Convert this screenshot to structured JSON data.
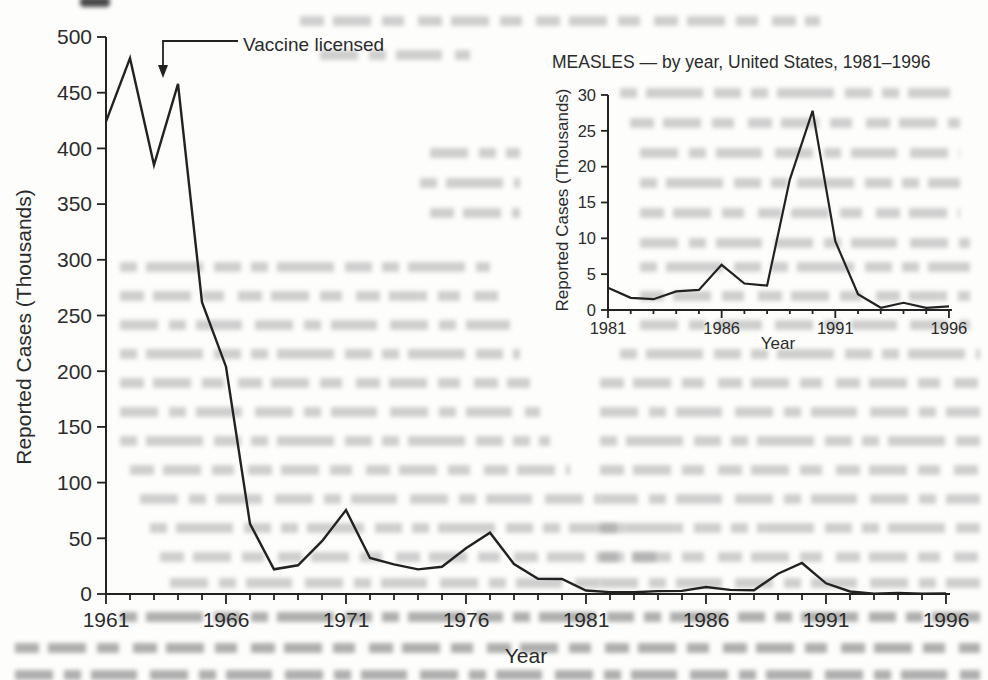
{
  "colors": {
    "paper": "#fdfdfc",
    "ink": "#222222",
    "text": "#2b2b2b"
  },
  "chart_data": [
    {
      "id": "main",
      "type": "line",
      "title": "",
      "xlabel": "Year",
      "ylabel": "Reported Cases (Thousands)",
      "xlim": [
        1961,
        1996
      ],
      "ylim": [
        0,
        500
      ],
      "x_major_ticks": [
        1961,
        1966,
        1971,
        1976,
        1981,
        1986,
        1991,
        1996
      ],
      "x_minor_tick_every": 1,
      "y_ticks": [
        0,
        50,
        100,
        150,
        200,
        250,
        300,
        350,
        400,
        450,
        500
      ],
      "grid": false,
      "legend": "none",
      "annotation": {
        "label": "Vaccine licensed",
        "target_year": 1963
      },
      "x": [
        1961,
        1962,
        1963,
        1964,
        1965,
        1966,
        1967,
        1968,
        1969,
        1970,
        1971,
        1972,
        1973,
        1974,
        1975,
        1976,
        1977,
        1978,
        1979,
        1980,
        1981,
        1982,
        1983,
        1984,
        1985,
        1986,
        1987,
        1988,
        1989,
        1990,
        1991,
        1992,
        1993,
        1994,
        1995,
        1996
      ],
      "values": [
        424,
        481,
        385,
        458,
        262,
        204,
        63,
        22.2,
        25.8,
        47.4,
        75.3,
        32.3,
        26.7,
        22.1,
        24.4,
        41.1,
        55,
        26.9,
        13.6,
        13.5,
        3.1,
        1.7,
        1.5,
        2.6,
        2.8,
        6.3,
        3.7,
        3.4,
        18.2,
        27.8,
        9.6,
        2.2,
        0.3,
        1,
        0.3,
        0.5
      ]
    },
    {
      "id": "inset",
      "type": "line",
      "title": "MEASLES — by year, United States, 1981–1996",
      "xlabel": "Year",
      "ylabel": "Reported Cases (Thousands)",
      "xlim": [
        1981,
        1996
      ],
      "ylim": [
        0,
        30
      ],
      "x_major_ticks": [
        1981,
        1986,
        1991,
        1996
      ],
      "x_minor_tick_every": 1,
      "y_ticks": [
        0,
        5,
        10,
        15,
        20,
        25,
        30
      ],
      "grid": false,
      "legend": "none",
      "x": [
        1981,
        1982,
        1983,
        1984,
        1985,
        1986,
        1987,
        1988,
        1989,
        1990,
        1991,
        1992,
        1993,
        1994,
        1995,
        1996
      ],
      "values": [
        3.1,
        1.7,
        1.5,
        2.6,
        2.8,
        6.3,
        3.7,
        3.4,
        18.2,
        27.8,
        9.6,
        2.2,
        0.3,
        1,
        0.3,
        0.5
      ]
    }
  ]
}
